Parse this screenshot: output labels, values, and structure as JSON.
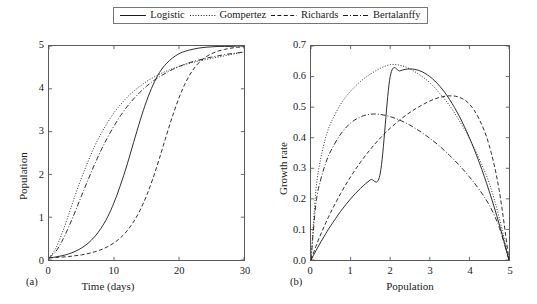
{
  "figure": {
    "panel_a_label": "(a)",
    "panel_b_label": "(b)"
  },
  "legend": {
    "position": "top-center",
    "items": [
      {
        "label": "Logistic",
        "style": "solid"
      },
      {
        "label": "Gompertez",
        "style": "dotted"
      },
      {
        "label": "Richards",
        "style": "dashed"
      },
      {
        "label": "Bertalanffy",
        "style": "dashdot"
      }
    ]
  },
  "chart_data": [
    {
      "type": "line",
      "panel": "(a)",
      "title": "",
      "xlabel": "Time (days)",
      "ylabel": "Population",
      "xlim": [
        0,
        30
      ],
      "ylim": [
        0,
        5
      ],
      "xticks": [
        "0",
        "10",
        "20",
        "30"
      ],
      "yticks": [
        "0",
        "1",
        "2",
        "3",
        "4",
        "5"
      ],
      "grid": false,
      "x": [
        0,
        1,
        2,
        3,
        4,
        5,
        6,
        7,
        8,
        9,
        10,
        11,
        12,
        13,
        14,
        15,
        16,
        17,
        18,
        19,
        20,
        21,
        22,
        23,
        24,
        25,
        26,
        27,
        28,
        29,
        30
      ],
      "series": [
        {
          "name": "Logistic",
          "style": "solid",
          "values": [
            0.05,
            0.07,
            0.1,
            0.14,
            0.2,
            0.28,
            0.39,
            0.54,
            0.74,
            1.0,
            1.34,
            1.75,
            2.22,
            2.74,
            3.25,
            3.71,
            4.09,
            4.38,
            4.58,
            4.72,
            4.82,
            4.88,
            4.92,
            4.95,
            4.97,
            4.98,
            4.99,
            4.99,
            4.99,
            5.0,
            5.0
          ]
        },
        {
          "name": "Gompertez",
          "style": "dotted",
          "values": [
            0.05,
            0.26,
            0.62,
            1.05,
            1.5,
            1.92,
            2.3,
            2.65,
            2.95,
            3.21,
            3.44,
            3.63,
            3.8,
            3.94,
            4.06,
            4.17,
            4.26,
            4.34,
            4.41,
            4.47,
            4.52,
            4.57,
            4.61,
            4.65,
            4.68,
            4.71,
            4.74,
            4.77,
            4.8,
            4.83,
            4.86
          ]
        },
        {
          "name": "Richards",
          "style": "dashed",
          "values": [
            0.05,
            0.06,
            0.07,
            0.08,
            0.1,
            0.12,
            0.15,
            0.19,
            0.24,
            0.31,
            0.4,
            0.52,
            0.68,
            0.89,
            1.16,
            1.5,
            1.91,
            2.38,
            2.88,
            3.36,
            3.79,
            4.14,
            4.41,
            4.6,
            4.73,
            4.82,
            4.88,
            4.92,
            4.95,
            4.97,
            4.98
          ]
        },
        {
          "name": "Bertalanffy",
          "style": "dashdot",
          "values": [
            0.05,
            0.19,
            0.44,
            0.76,
            1.12,
            1.5,
            1.87,
            2.23,
            2.56,
            2.86,
            3.13,
            3.37,
            3.58,
            3.76,
            3.92,
            4.06,
            4.18,
            4.28,
            4.37,
            4.45,
            4.52,
            4.58,
            4.63,
            4.67,
            4.71,
            4.74,
            4.77,
            4.8,
            4.82,
            4.84,
            4.86
          ]
        }
      ]
    },
    {
      "type": "line",
      "panel": "(b)",
      "title": "",
      "xlabel": "Population",
      "ylabel": "Growth rate",
      "xlim": [
        0,
        5
      ],
      "ylim": [
        0,
        0.7
      ],
      "xticks": [
        "0",
        "1",
        "2",
        "3",
        "4",
        "5"
      ],
      "yticks": [
        "0.0",
        "0.1",
        "0.2",
        "0.3",
        "0.4",
        "0.5",
        "0.6",
        "0.7"
      ],
      "grid": false,
      "x": [
        0,
        0.125,
        0.25,
        0.375,
        0.5,
        0.75,
        1,
        1.25,
        1.5,
        1.75,
        2,
        2.25,
        2.5,
        2.75,
        3,
        3.25,
        3.5,
        3.75,
        4,
        4.25,
        4.5,
        4.75,
        5
      ],
      "series": [
        {
          "name": "Logistic",
          "style": "solid",
          "peak_x": 2.5,
          "peak_y": 0.625,
          "values": [
            0,
            0.0305,
            0.0595,
            0.087,
            0.1125,
            0.1594,
            0.2,
            0.2344,
            0.2625,
            0.2844,
            0.6,
            0.6188,
            0.625,
            0.6188,
            0.6,
            0.5688,
            0.525,
            0.4688,
            0.4,
            0.3188,
            0.225,
            0.1188,
            0
          ]
        },
        {
          "name": "Gompertez",
          "style": "dotted",
          "peak_x": 1.85,
          "peak_y": 0.64,
          "values": [
            0,
            0.23,
            0.335,
            0.402,
            0.448,
            0.51,
            0.552,
            0.584,
            0.608,
            0.627,
            0.639,
            0.637,
            0.625,
            0.605,
            0.58,
            0.545,
            0.505,
            0.455,
            0.398,
            0.33,
            0.252,
            0.14,
            0
          ]
        },
        {
          "name": "Richards",
          "style": "dashed",
          "peak_x": 2.72,
          "peak_y": 0.537,
          "values": [
            0,
            0.045,
            0.085,
            0.122,
            0.156,
            0.218,
            0.272,
            0.32,
            0.362,
            0.399,
            0.431,
            0.459,
            0.483,
            0.503,
            0.52,
            0.532,
            0.537,
            0.532,
            0.51,
            0.46,
            0.375,
            0.23,
            0
          ]
        },
        {
          "name": "Bertalanffy",
          "style": "dashdot",
          "peak_x": 1.5,
          "peak_y": 0.477,
          "values": [
            0,
            0.185,
            0.265,
            0.318,
            0.357,
            0.412,
            0.448,
            0.468,
            0.477,
            0.476,
            0.469,
            0.457,
            0.441,
            0.421,
            0.398,
            0.372,
            0.342,
            0.309,
            0.272,
            0.23,
            0.18,
            0.108,
            0
          ]
        }
      ]
    }
  ]
}
